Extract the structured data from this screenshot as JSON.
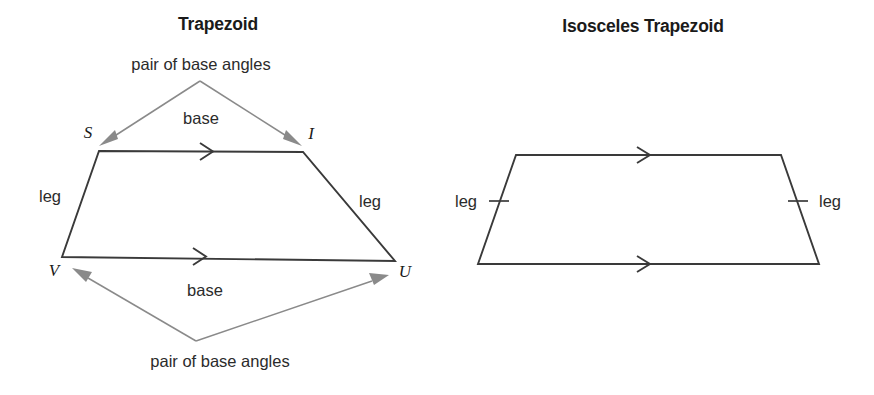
{
  "figure": {
    "width": 874,
    "height": 395,
    "background": "#ffffff",
    "shape_stroke": "#3a3a3a",
    "leader_color": "#8a8a8a",
    "text_color": "#2b2b2b"
  },
  "panels": [
    {
      "id": "trapezoid",
      "title": "Trapezoid",
      "vertices": [
        {
          "name": "S",
          "label": "S"
        },
        {
          "name": "I",
          "label": "I"
        },
        {
          "name": "U",
          "label": "U"
        },
        {
          "name": "V",
          "label": "V"
        }
      ],
      "labels": {
        "top_callout": "pair of base angles",
        "top_base": "base",
        "left_leg": "leg",
        "right_leg": "leg",
        "bottom_base": "base",
        "bottom_callout": "pair of base angles"
      }
    },
    {
      "id": "isosceles-trapezoid",
      "title": "Isosceles Trapezoid",
      "labels": {
        "left_leg": "leg",
        "right_leg": "leg"
      },
      "marks": {
        "parallel_sides": 2,
        "congruent_legs": 2
      }
    }
  ]
}
